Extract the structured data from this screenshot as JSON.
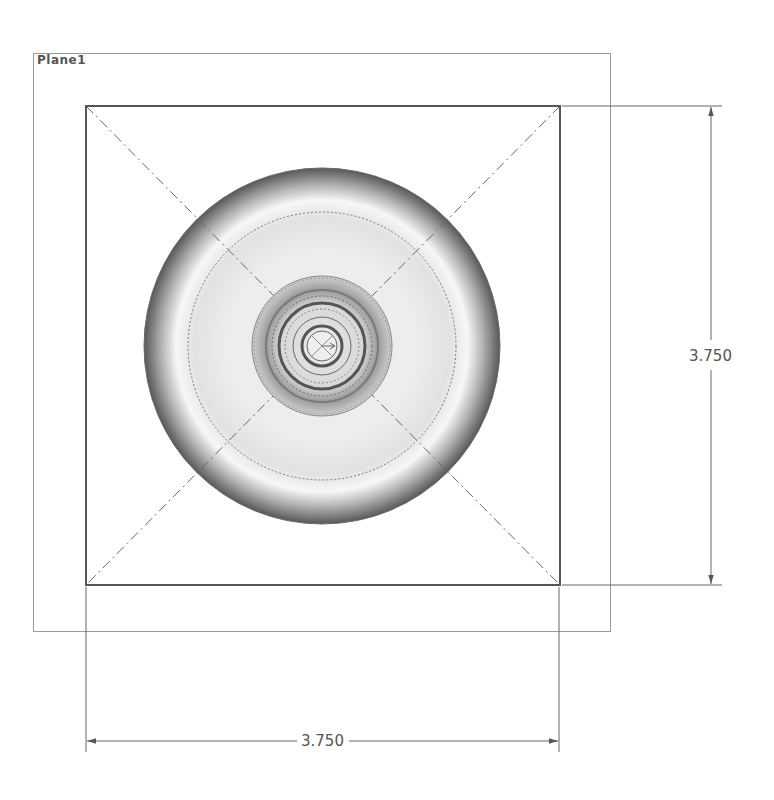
{
  "plane": {
    "label": "Plane1"
  },
  "dimensions": {
    "vertical": {
      "value": "3.750"
    },
    "horizontal": {
      "value": "3.750"
    }
  },
  "colors": {
    "line": "#555555",
    "construction": "#666666",
    "plane_border": "#9a9a9a",
    "shade_dark": "#5a5a5a",
    "shade_light": "#f2f2f2"
  }
}
